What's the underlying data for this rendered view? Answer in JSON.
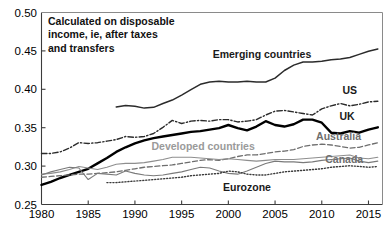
{
  "chart_data": {
    "type": "line",
    "title": "",
    "annotation": "Calculated on disposable income, ie, after taxes and transfers",
    "xlabel": "",
    "ylabel": "",
    "xlim": [
      1980,
      2016.5
    ],
    "ylim": [
      0.25,
      0.5
    ],
    "yticks": [
      0.25,
      0.3,
      0.35,
      0.4,
      0.45,
      0.5
    ],
    "ytick_labels": [
      "0.25",
      "0.30",
      "0.35",
      "0.40",
      "0.45",
      "0.50"
    ],
    "xticks": [
      1980,
      1985,
      1990,
      1995,
      2000,
      2005,
      2010,
      2015
    ],
    "xtick_labels": [
      "1980",
      "1985",
      "1990",
      "1995",
      "2000",
      "2005",
      "2010",
      "2015"
    ],
    "grid": false,
    "legend_position": "inline-labels",
    "series": [
      {
        "name": "Emerging countries",
        "style": "solid",
        "color": "#2b2b2b",
        "width": 1.5,
        "label_color": "dark",
        "label_x": 2003.6,
        "label_y": 0.4405,
        "x": [
          1988,
          1989,
          1990,
          1991,
          1992,
          1993,
          1994,
          1995,
          1996,
          1997,
          1998,
          1999,
          2000,
          2001,
          2002,
          2003,
          2004,
          2005,
          2006,
          2007,
          2008,
          2009,
          2010,
          2011,
          2012,
          2013,
          2014,
          2015,
          2016
        ],
        "values": [
          0.377,
          0.379,
          0.378,
          0.3755,
          0.3765,
          0.3815,
          0.386,
          0.3925,
          0.3995,
          0.4065,
          0.4095,
          0.4105,
          0.4095,
          0.4095,
          0.4105,
          0.4095,
          0.4095,
          0.4145,
          0.4245,
          0.4315,
          0.4355,
          0.4355,
          0.4365,
          0.4385,
          0.4395,
          0.4415,
          0.4455,
          0.4495,
          0.4525
        ]
      },
      {
        "name": "US",
        "style": "dashdot",
        "color": "#2b2b2b",
        "width": 1.4,
        "label_color": "dark",
        "label_x": 2013.0,
        "label_y": 0.3935,
        "x": [
          1980,
          1981,
          1982,
          1983,
          1984,
          1985,
          1986,
          1987,
          1988,
          1989,
          1990,
          1991,
          1992,
          1993,
          1994,
          1995,
          1996,
          1997,
          1998,
          1999,
          2000,
          2001,
          2002,
          2003,
          2004,
          2005,
          2006,
          2007,
          2008,
          2009,
          2010,
          2011,
          2012,
          2013,
          2014,
          2015,
          2016
        ],
        "values": [
          0.3165,
          0.3165,
          0.3185,
          0.3235,
          0.3305,
          0.3295,
          0.3305,
          0.3325,
          0.3345,
          0.3385,
          0.3375,
          0.3385,
          0.3425,
          0.3505,
          0.3595,
          0.3555,
          0.3585,
          0.3595,
          0.3585,
          0.3605,
          0.3605,
          0.3575,
          0.3585,
          0.3605,
          0.3665,
          0.3715,
          0.3725,
          0.3705,
          0.3685,
          0.3665,
          0.3745,
          0.3785,
          0.3815,
          0.3785,
          0.3805,
          0.3835,
          0.3845
        ]
      },
      {
        "name": "UK",
        "style": "solid",
        "color": "#000000",
        "width": 2.4,
        "label_color": "dark",
        "label_x": 2012.7,
        "label_y": 0.3605,
        "x": [
          1980,
          1981,
          1982,
          1983,
          1984,
          1985,
          1986,
          1987,
          1988,
          1989,
          1990,
          1991,
          1992,
          1993,
          1994,
          1995,
          1996,
          1997,
          1998,
          1999,
          2000,
          2001,
          2002,
          2003,
          2004,
          2005,
          2006,
          2007,
          2008,
          2009,
          2010,
          2011,
          2012,
          2013,
          2014,
          2015,
          2016
        ],
        "values": [
          0.2755,
          0.2795,
          0.2845,
          0.2885,
          0.2925,
          0.2965,
          0.3035,
          0.3105,
          0.3185,
          0.3245,
          0.3295,
          0.3335,
          0.3365,
          0.3385,
          0.3405,
          0.3425,
          0.3445,
          0.3455,
          0.3475,
          0.3495,
          0.3535,
          0.3495,
          0.3465,
          0.3515,
          0.3585,
          0.3535,
          0.3515,
          0.3545,
          0.3605,
          0.3605,
          0.3565,
          0.3435,
          0.3425,
          0.3455,
          0.3435,
          0.3475,
          0.3505
        ]
      },
      {
        "name": "Australia",
        "style": "dashed",
        "color": "#6e6e6e",
        "width": 1.3,
        "label_color": "mid",
        "label_x": 2011.8,
        "label_y": 0.3345,
        "x": [
          1980,
          1981,
          1982,
          1983,
          1984,
          1985,
          1986,
          1987,
          1988,
          1989,
          1990,
          1991,
          1992,
          1993,
          1994,
          1995,
          1996,
          1997,
          1998,
          1999,
          2000,
          2001,
          2002,
          2003,
          2004,
          2005,
          2006,
          2007,
          2008,
          2009,
          2010,
          2011,
          2012,
          2013,
          2014,
          2015,
          2016
        ],
        "values": [
          0.2855,
          0.2865,
          0.2875,
          0.2885,
          0.2895,
          0.2895,
          0.2905,
          0.2915,
          0.2925,
          0.2945,
          0.2965,
          0.2985,
          0.2995,
          0.3005,
          0.3015,
          0.3035,
          0.3055,
          0.3075,
          0.3085,
          0.3075,
          0.3095,
          0.3125,
          0.3145,
          0.3145,
          0.3165,
          0.3185,
          0.3195,
          0.3215,
          0.3255,
          0.3275,
          0.3285,
          0.3275,
          0.3255,
          0.3235,
          0.3245,
          0.3275,
          0.3305
        ]
      },
      {
        "name": "Developed countries",
        "style": "solid",
        "color": "#8e8e8e",
        "width": 1.1,
        "label_color": "gray",
        "label_x": 1997.3,
        "label_y": 0.3215,
        "x": [
          1980,
          1981,
          1982,
          1983,
          1984,
          1985,
          1986,
          1987,
          1988,
          1989,
          1990,
          1991,
          1992,
          1993,
          1994,
          1995,
          1996,
          1997,
          1998,
          1999,
          2000,
          2001,
          2002,
          2003,
          2004,
          2005,
          2006,
          2007,
          2008,
          2009,
          2010,
          2011,
          2012,
          2013,
          2014,
          2015,
          2016
        ],
        "values": [
          0.2895,
          0.2905,
          0.2925,
          0.2955,
          0.2995,
          0.2975,
          0.2955,
          0.2985,
          0.3025,
          0.3035,
          0.3035,
          0.3045,
          0.3065,
          0.3085,
          0.3115,
          0.3115,
          0.3115,
          0.3105,
          0.3095,
          0.3085,
          0.3095,
          0.3085,
          0.3075,
          0.3065,
          0.3075,
          0.3085,
          0.3085,
          0.3085,
          0.3095,
          0.3105,
          0.3115,
          0.3125,
          0.3135,
          0.3145,
          0.3105,
          0.3095,
          0.3115
        ]
      },
      {
        "name": "Canada",
        "style": "solid",
        "color": "#7a7a7a",
        "width": 1.1,
        "label_color": "mid",
        "label_x": 2012.4,
        "label_y": 0.3045,
        "x": [
          1980,
          1981,
          1982,
          1983,
          1984,
          1985,
          1986,
          1987,
          1988,
          1989,
          1990,
          1991,
          1992,
          1993,
          1994,
          1995,
          1996,
          1997,
          1998,
          1999,
          2000,
          2001,
          2002,
          2003,
          2004,
          2005,
          2006,
          2007,
          2008,
          2009,
          2010,
          2011,
          2012,
          2013,
          2014,
          2015,
          2016
        ],
        "values": [
          0.2885,
          0.2925,
          0.2955,
          0.2985,
          0.2975,
          0.2825,
          0.2905,
          0.2895,
          0.2885,
          0.2935,
          0.2905,
          0.2885,
          0.2875,
          0.2885,
          0.2905,
          0.2925,
          0.2955,
          0.2985,
          0.2975,
          0.2935,
          0.2905,
          0.2895,
          0.2935,
          0.2985,
          0.3035,
          0.3065,
          0.3055,
          0.3055,
          0.3045,
          0.3055,
          0.3075,
          0.3085,
          0.3095,
          0.3105,
          0.3065,
          0.3045,
          0.3065
        ]
      },
      {
        "name": "Eurozone",
        "style": "dotted",
        "color": "#3a3a3a",
        "width": 1.4,
        "label_color": "dark",
        "label_x": 2002.0,
        "label_y": 0.2675,
        "x": [
          1987,
          1988,
          1989,
          1990,
          1991,
          1992,
          1993,
          1994,
          1995,
          1996,
          1997,
          1998,
          1999,
          2000,
          2001,
          2002,
          2003,
          2004,
          2005,
          2006,
          2007,
          2008,
          2009,
          2010,
          2011,
          2012,
          2013,
          2014,
          2015,
          2016
        ],
        "values": [
          0.2785,
          0.2785,
          0.2795,
          0.2805,
          0.2815,
          0.2825,
          0.2835,
          0.2845,
          0.2855,
          0.2875,
          0.2885,
          0.2895,
          0.2905,
          0.2935,
          0.2925,
          0.2895,
          0.2885,
          0.2885,
          0.2905,
          0.2925,
          0.2935,
          0.2945,
          0.2955,
          0.2965,
          0.2985,
          0.2995,
          0.3005,
          0.2995,
          0.2985,
          0.2995
        ]
      }
    ]
  }
}
